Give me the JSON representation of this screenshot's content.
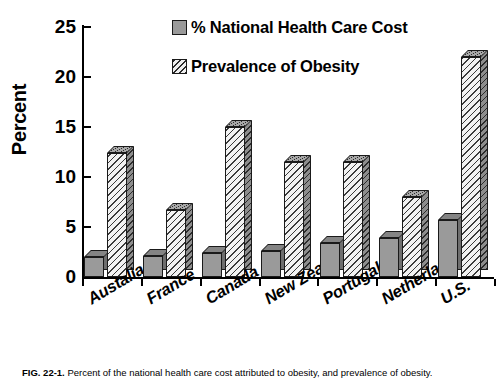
{
  "chart_data": {
    "type": "bar",
    "title": "",
    "xlabel": "",
    "ylabel": "Percent",
    "ylim": [
      0,
      25
    ],
    "yticks": [
      0,
      5,
      10,
      15,
      20,
      25
    ],
    "grid": false,
    "legend_position": "top-center",
    "categories": [
      "Austalia",
      "France",
      "Canada",
      "New Zealand",
      "Portugal",
      "Netherlands",
      "U.S."
    ],
    "series": [
      {
        "name": "% National Health Care Cost",
        "style": "solid-gray",
        "color": "#9a9a9a",
        "values": [
          2.0,
          2.1,
          2.4,
          2.6,
          3.4,
          3.9,
          5.7
        ]
      },
      {
        "name": "Prevalence of Obesity",
        "style": "diagonal-hatch",
        "color": "#f2f2f2",
        "values": [
          12.4,
          6.7,
          15.0,
          11.5,
          11.5,
          8.0,
          22.0
        ]
      }
    ]
  },
  "axis": {
    "y_title": "Percent",
    "y_tick_labels": [
      "0",
      "5",
      "10",
      "15",
      "20",
      "25"
    ]
  },
  "legend": {
    "items": [
      {
        "label": "% National Health Care Cost",
        "swatch": "solid-swatch-icon"
      },
      {
        "label": "Prevalence of Obesity",
        "swatch": "hatch-swatch-icon"
      }
    ]
  },
  "caption": {
    "figure_number": "FIG. 22-1.",
    "text": "Percent of the national health care cost attributed to obesity, and prevalence of obesity."
  }
}
